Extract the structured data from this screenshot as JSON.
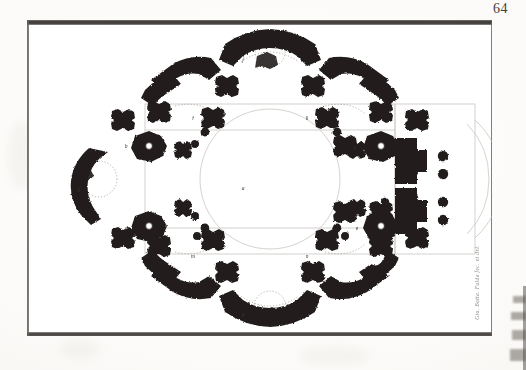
{
  "document": {
    "type": "engraved-plate",
    "folio_number": "64",
    "caption_signature": "Gio. Batta. Falda fec. et del.",
    "plate_title": "",
    "subject": "centralized church ground plan"
  },
  "plate": {
    "frame": {
      "x": 27,
      "y": 20,
      "width": 465,
      "height": 316
    },
    "ink_color": "#241f1c",
    "paper_color": "#fbfaf8",
    "border_color": "#2b2825"
  },
  "plan_labels": [
    {
      "id": "a",
      "text": "a",
      "x": 243,
      "y": 188,
      "note": "central crossing"
    },
    {
      "id": "b",
      "text": "b",
      "x": 126,
      "y": 146,
      "note": "stair pier west"
    },
    {
      "id": "c",
      "text": "c",
      "x": 355,
      "y": 148,
      "note": "stair pier east"
    },
    {
      "id": "d",
      "text": "d",
      "x": 126,
      "y": 228,
      "note": "stair pier south-west"
    },
    {
      "id": "e",
      "text": "e",
      "x": 357,
      "y": 228,
      "note": "stair pier south-east"
    },
    {
      "id": "f",
      "text": "f",
      "x": 243,
      "y": 60,
      "note": "north apse chapel"
    },
    {
      "id": "g",
      "text": "g",
      "x": 243,
      "y": 312,
      "note": "south apse chapel"
    },
    {
      "id": "h",
      "text": "h",
      "x": 78,
      "y": 190,
      "note": "west apse"
    },
    {
      "id": "i",
      "text": "i",
      "x": 412,
      "y": 190,
      "note": "east apse"
    },
    {
      "id": "k",
      "text": "k",
      "x": 300,
      "y": 120,
      "note": "corner chapel"
    },
    {
      "id": "l",
      "text": "l",
      "x": 184,
      "y": 120,
      "note": "corner chapel"
    },
    {
      "id": "m",
      "text": "m",
      "x": 184,
      "y": 256,
      "note": "corner chapel"
    },
    {
      "id": "n",
      "text": "n",
      "x": 300,
      "y": 256,
      "note": "corner chapel"
    }
  ],
  "artifacts": {
    "edge_marks_label": "scan-edge-marks",
    "spine_label": "book-spine-shadow"
  }
}
